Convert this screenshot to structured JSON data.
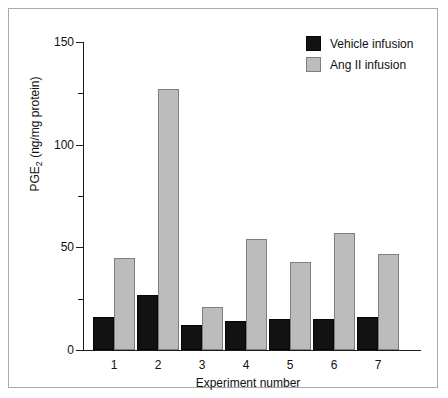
{
  "chart_data": {
    "type": "bar",
    "title": "",
    "xlabel": "Experiment number",
    "ylabel": "PGE2 (ng/mg protein)",
    "ylabel_base": "PGE",
    "ylabel_sub": "2",
    "ylabel_rest": " (ng/mg protein)",
    "categories": [
      "1",
      "2",
      "3",
      "4",
      "5",
      "6",
      "7"
    ],
    "series": [
      {
        "name": "Vehicle infusion",
        "color": "#121212",
        "values": [
          16,
          27,
          12,
          14,
          15,
          15,
          16
        ]
      },
      {
        "name": "Ang II infusion",
        "color": "#bcbcbc",
        "values": [
          45,
          127,
          21,
          54,
          43,
          57,
          47
        ]
      }
    ],
    "ylim": [
      0,
      150
    ],
    "y_major_ticks": [
      0,
      50,
      100,
      150
    ],
    "y_minor_ticks": [
      25,
      75,
      125
    ],
    "y_tick_labels": [
      "0",
      "50",
      "100",
      "150"
    ],
    "grid": false,
    "legend_position": "top-right"
  },
  "legend": {
    "entries": [
      {
        "label": "Vehicle infusion",
        "swatch": "vehicle"
      },
      {
        "label": "Ang II infusion",
        "swatch": "angii"
      }
    ]
  },
  "colors": {
    "vehicle_fill": "#121212",
    "angii_fill": "#bcbcbc",
    "angii_stroke": "#7e7e7e",
    "axis": "#1a1a1a",
    "frame": "#a9a9a9",
    "text": "#111111",
    "background": "#ffffff"
  }
}
